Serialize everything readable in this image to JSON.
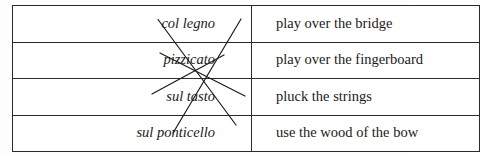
{
  "exercise": {
    "title": "Matching exercise: string-instrument playing techniques",
    "columns": {
      "left_header": "col legno",
      "right_header": "play over the bridge"
    },
    "rows": [
      {
        "term": "col legno",
        "definition": "play over the bridge"
      },
      {
        "term": "pizzicato",
        "definition": "play over the fingerboard"
      },
      {
        "term": "sul tasto",
        "definition": "pluck the strings"
      },
      {
        "term": "sul ponticello",
        "definition": "use the wood of the bow"
      }
    ],
    "connections": [
      {
        "from_term": "col legno",
        "to_definition": "use the wood of the bow",
        "from_row": 0,
        "to_row": 3
      },
      {
        "from_term": "pizzicato",
        "to_definition": "pluck the strings",
        "from_row": 1,
        "to_row": 2
      },
      {
        "from_term": "sul tasto",
        "to_definition": "play over the fingerboard",
        "from_row": 2,
        "to_row": 1
      },
      {
        "from_term": "sul ponticello",
        "to_definition": "play over the bridge",
        "from_row": 3,
        "to_row": 0
      }
    ],
    "colors": {
      "border": "#2b2b2b",
      "line": "#1b1b1b",
      "text": "#1a1a1a",
      "background": "#ffffff"
    }
  }
}
